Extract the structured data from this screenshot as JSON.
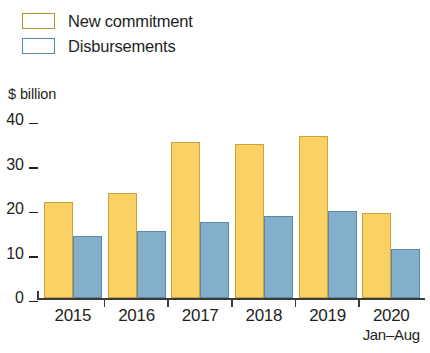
{
  "legend": {
    "items": [
      {
        "label": "New commitment",
        "color": "#f9d263",
        "key": "new_commitment"
      },
      {
        "label": "Disbursements",
        "color": "#82afcc",
        "key": "disbursements"
      }
    ]
  },
  "axis": {
    "y_title": "$ billion",
    "y_ticks": [
      "40",
      "30",
      "20",
      "10",
      "0"
    ]
  },
  "chart_data": {
    "type": "bar",
    "title": "",
    "subtitle": "",
    "xlabel": "",
    "ylabel": "$ billion",
    "ylim": [
      0,
      40
    ],
    "yticks": [
      0,
      10,
      20,
      30,
      40
    ],
    "grid": false,
    "legend_position": "top-left",
    "categories": [
      "2015",
      "2016",
      "2017",
      "2018",
      "2019",
      "2020"
    ],
    "category_sublabels": [
      "",
      "",
      "",
      "",
      "",
      "Jan–Aug"
    ],
    "series": [
      {
        "name": "New commitment",
        "color": "#f9d263",
        "values": [
          21.5,
          23.5,
          35.0,
          34.5,
          36.5,
          19.0
        ]
      },
      {
        "name": "Disbursements",
        "color": "#82afcc",
        "values": [
          14.0,
          15.0,
          17.0,
          18.5,
          19.5,
          11.0
        ]
      }
    ]
  }
}
